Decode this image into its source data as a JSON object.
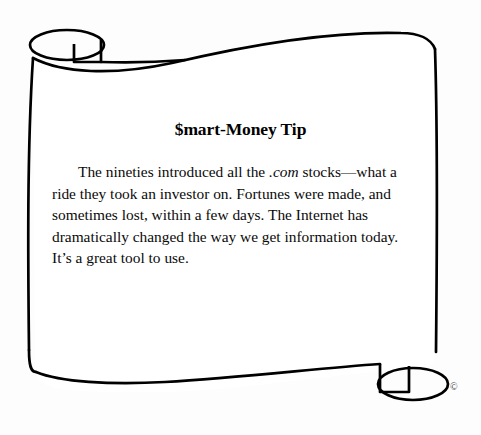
{
  "illustration": {
    "type": "scroll-parchment",
    "ink_color": "#000000",
    "paper_color": "#ffffff",
    "stroke_width": 2.6
  },
  "tip": {
    "title": "$mart-Money Tip",
    "body_prefix": "The nineties introduced all the ",
    "body_italic": ".com",
    "body_suffix": " stocks—what a ride they took an investor on. Fortunes were made, and sometimes lost, within a few days. The Internet has dramatically changed the way we get information today. It’s a great tool to use.",
    "body_lines": [
      "The nineties introduced all the .com stocks—what a",
      "ride they took an investor on. Fortunes were made, and",
      "sometimes lost, within a few days. The Internet has",
      "dramatically changed the way we get information today.",
      "It’s a great tool to use."
    ]
  },
  "marks": {
    "copyright": "©"
  }
}
